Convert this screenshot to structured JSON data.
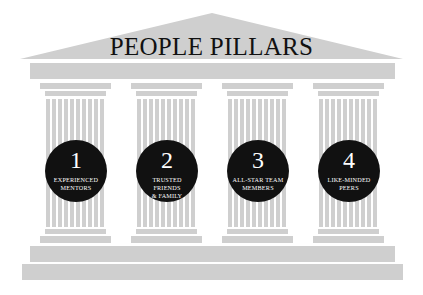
{
  "title": "PEOPLE PILLARS",
  "colors": {
    "stone": "#cfcfcf",
    "circle": "#111111",
    "circle_text": "#ffffff",
    "title_text": "#111111",
    "background": "#ffffff"
  },
  "pillars": [
    {
      "number": "1",
      "label_line1": "EXPERIENCED",
      "label_line2": "MENTORS"
    },
    {
      "number": "2",
      "label_line1": "TRUSTED FRIENDS",
      "label_line2": "& FAMILY"
    },
    {
      "number": "3",
      "label_line1": "ALL-STAR TEAM",
      "label_line2": "MEMBERS"
    },
    {
      "number": "4",
      "label_line1": "LIKE-MINDED",
      "label_line2": "PEERS"
    }
  ]
}
